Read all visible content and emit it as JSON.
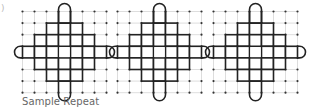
{
  "figure": {
    "fragment_label": ")",
    "caption": "Sample Repeat",
    "colors": {
      "grid_line": "#d4d4d4",
      "grid_dot": "#333333",
      "motif_line": "#222222",
      "caption": "#666666"
    },
    "grid": {
      "cols": 7,
      "rows": 7,
      "cell_w": 12,
      "cell_h": 11.6,
      "top": 11.5,
      "block_lefts": [
        22.5,
        117.5,
        213.5
      ]
    },
    "motif": {
      "description": "stepped diamond of cells with rounded vertical bar through center column and rounded horizontal bar through center row; center cell empty",
      "rows": [
        {
          "row": 1,
          "cols": [
            2,
            3,
            4
          ]
        },
        {
          "row": 2,
          "cols": [
            1,
            2,
            3,
            4,
            5
          ]
        },
        {
          "row": 3,
          "cols": [
            0,
            1,
            2,
            4,
            5,
            6
          ]
        },
        {
          "row": 4,
          "cols": [
            1,
            2,
            3,
            4,
            5
          ]
        },
        {
          "row": 5,
          "cols": [
            2,
            3,
            4
          ]
        }
      ],
      "vertical_bar_col": 3,
      "horizontal_bar_row": 3,
      "empty_center": {
        "row": 3,
        "col": 3
      }
    },
    "repeat_count": 3
  }
}
